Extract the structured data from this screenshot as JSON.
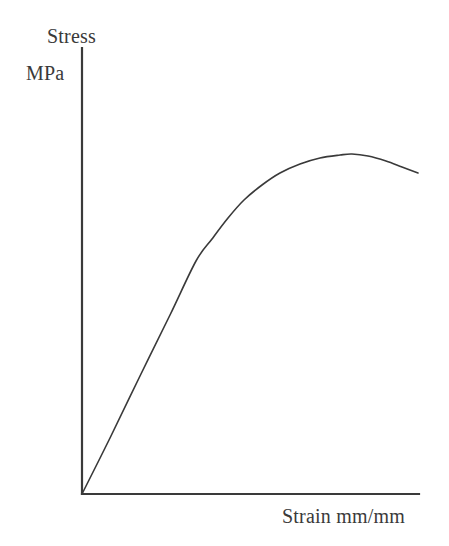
{
  "figure": {
    "kind": "stress-strain-diagram",
    "background_color": "#ffffff",
    "line_color": "#3a3a3a",
    "width": 449,
    "height": 546
  },
  "labels": {
    "y_axis_title": "Stress",
    "y_axis_units": "MPa",
    "x_axis_title": "Strain mm/mm"
  },
  "axes": {
    "y_axis_name": "y-axis-line",
    "x_axis_name": "x-axis-line",
    "origin_x": 82,
    "origin_y": 494,
    "y_axis_top": 48,
    "x_axis_right": 419,
    "stroke_width": 2.2,
    "ticks": [],
    "grid": false
  },
  "chart_data": {
    "type": "line",
    "title": "",
    "subtitle": "",
    "xlabel": "Strain mm/mm",
    "ylabel": "Stress MPa",
    "xlim": [
      0,
      1
    ],
    "ylim": [
      0,
      1
    ],
    "grid": false,
    "legend": null,
    "tick_labels": {
      "x": [],
      "y": []
    },
    "annotations": [],
    "series": [
      {
        "name": "Stress-strain response",
        "description": "Linear elastic rise, yielding knee, strain-hardening to an ultimate peak, then slight softening toward fracture.",
        "units": {
          "x": "mm/mm",
          "y": "MPa"
        },
        "points_px": [
          [
            82,
            494
          ],
          [
            110,
            438
          ],
          [
            140,
            376
          ],
          [
            170,
            315
          ],
          [
            196,
            261
          ],
          [
            212,
            239
          ],
          [
            228,
            218
          ],
          [
            244,
            200
          ],
          [
            262,
            185
          ],
          [
            280,
            173
          ],
          [
            300,
            164
          ],
          [
            320,
            158
          ],
          [
            340,
            155
          ],
          [
            352,
            154
          ],
          [
            368,
            156
          ],
          [
            386,
            161
          ],
          [
            402,
            167
          ],
          [
            418,
            173
          ]
        ],
        "points_normalized": {
          "x": [
            0.0,
            0.08,
            0.17,
            0.26,
            0.34,
            0.39,
            0.43,
            0.48,
            0.53,
            0.59,
            0.65,
            0.71,
            0.77,
            0.8,
            0.85,
            0.9,
            0.95,
            1.0
          ],
          "y": [
            0.0,
            0.13,
            0.26,
            0.4,
            0.52,
            0.57,
            0.62,
            0.66,
            0.69,
            0.72,
            0.74,
            0.75,
            0.76,
            0.76,
            0.76,
            0.75,
            0.73,
            0.72
          ]
        },
        "stroke_width": 1.6
      }
    ],
    "features": {
      "proportional_limit_px": [
        196,
        261
      ],
      "ultimate_peak_px": [
        352,
        154
      ],
      "fracture_end_px": [
        418,
        173
      ]
    }
  }
}
